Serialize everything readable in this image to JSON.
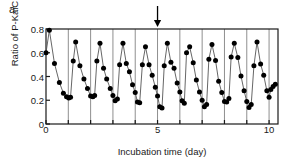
{
  "panel": {
    "label": "a"
  },
  "axes": {
    "ylabel": "Ratio of P-KaiC",
    "xlabel": "Incubation time (day)",
    "yticks": [
      "0",
      "0.2",
      "0.4",
      "0.6",
      "0.8"
    ],
    "ytick_values": [
      0,
      0.2,
      0.4,
      0.6,
      0.8
    ],
    "xticks": [
      "0",
      "5",
      "10"
    ],
    "xtick_values": [
      0,
      5,
      10
    ]
  },
  "annotation": {
    "arrow_name": "down-arrow-marker",
    "arrow_x_day": 5
  },
  "chart_data": {
    "type": "line",
    "title": "",
    "subtitle": "",
    "xlabel": "Incubation time (day)",
    "ylabel": "Ratio of P-KaiC",
    "xlim": [
      0,
      10.4
    ],
    "ylim": [
      0,
      0.8
    ],
    "grid": "vertical gridlines at every integer day from 1 to 10",
    "legend": "none",
    "marker": "filled circle",
    "line_color": "#555555",
    "marker_color": "#000000",
    "annotations": [
      {
        "type": "arrow",
        "direction": "down",
        "x": 5,
        "note": "downward arrow above plot at day 5"
      }
    ],
    "series": [
      {
        "name": "Ratio of P-KaiC",
        "points": [
          [
            0.0,
            0.6
          ],
          [
            0.15,
            0.79
          ],
          [
            0.38,
            0.51
          ],
          [
            0.6,
            0.35
          ],
          [
            0.78,
            0.26
          ],
          [
            0.92,
            0.23
          ],
          [
            1.02,
            0.22
          ],
          [
            1.1,
            0.225
          ],
          [
            1.22,
            0.53
          ],
          [
            1.33,
            0.69
          ],
          [
            1.52,
            0.49
          ],
          [
            1.7,
            0.38
          ],
          [
            1.86,
            0.3
          ],
          [
            2.0,
            0.235
          ],
          [
            2.1,
            0.23
          ],
          [
            2.18,
            0.24
          ],
          [
            2.28,
            0.53
          ],
          [
            2.42,
            0.68
          ],
          [
            2.58,
            0.47
          ],
          [
            2.72,
            0.38
          ],
          [
            2.88,
            0.3
          ],
          [
            3.0,
            0.24
          ],
          [
            3.1,
            0.195
          ],
          [
            3.2,
            0.21
          ],
          [
            3.3,
            0.5
          ],
          [
            3.45,
            0.68
          ],
          [
            3.6,
            0.51
          ],
          [
            3.74,
            0.44
          ],
          [
            3.88,
            0.33
          ],
          [
            4.0,
            0.265
          ],
          [
            4.1,
            0.185
          ],
          [
            4.2,
            0.18
          ],
          [
            4.32,
            0.5
          ],
          [
            4.46,
            0.65
          ],
          [
            4.62,
            0.5
          ],
          [
            4.76,
            0.41
          ],
          [
            4.9,
            0.31
          ],
          [
            5.0,
            0.235
          ],
          [
            5.1,
            0.145
          ],
          [
            5.2,
            0.135
          ],
          [
            5.3,
            0.49
          ],
          [
            5.44,
            0.68
          ],
          [
            5.6,
            0.52
          ],
          [
            5.74,
            0.47
          ],
          [
            5.88,
            0.345
          ],
          [
            6.0,
            0.27
          ],
          [
            6.1,
            0.195
          ],
          [
            6.2,
            0.175
          ],
          [
            6.3,
            0.6
          ],
          [
            6.44,
            0.65
          ],
          [
            6.6,
            0.515
          ],
          [
            6.74,
            0.37
          ],
          [
            6.88,
            0.27
          ],
          [
            7.0,
            0.2
          ],
          [
            7.1,
            0.145
          ],
          [
            7.2,
            0.165
          ],
          [
            7.3,
            0.545
          ],
          [
            7.44,
            0.67
          ],
          [
            7.6,
            0.535
          ],
          [
            7.74,
            0.36
          ],
          [
            7.88,
            0.265
          ],
          [
            8.0,
            0.19
          ],
          [
            8.1,
            0.185
          ],
          [
            8.2,
            0.215
          ],
          [
            8.3,
            0.565
          ],
          [
            8.44,
            0.68
          ],
          [
            8.6,
            0.56
          ],
          [
            8.74,
            0.405
          ],
          [
            8.88,
            0.28
          ],
          [
            9.0,
            0.19
          ],
          [
            9.1,
            0.14
          ],
          [
            9.2,
            0.165
          ],
          [
            9.32,
            0.49
          ],
          [
            9.46,
            0.69
          ],
          [
            9.62,
            0.505
          ],
          [
            9.76,
            0.41
          ],
          [
            9.9,
            0.28
          ],
          [
            10.0,
            0.225
          ],
          [
            10.08,
            0.29
          ],
          [
            10.18,
            0.315
          ],
          [
            10.28,
            0.335
          ]
        ]
      }
    ]
  },
  "style": {
    "axis_color": "#1a1a1a",
    "grid_color": "#8f8f8f",
    "plot_left_px": 46,
    "plot_right_px": 278,
    "plot_top_px": 29,
    "plot_bottom_px": 124
  }
}
